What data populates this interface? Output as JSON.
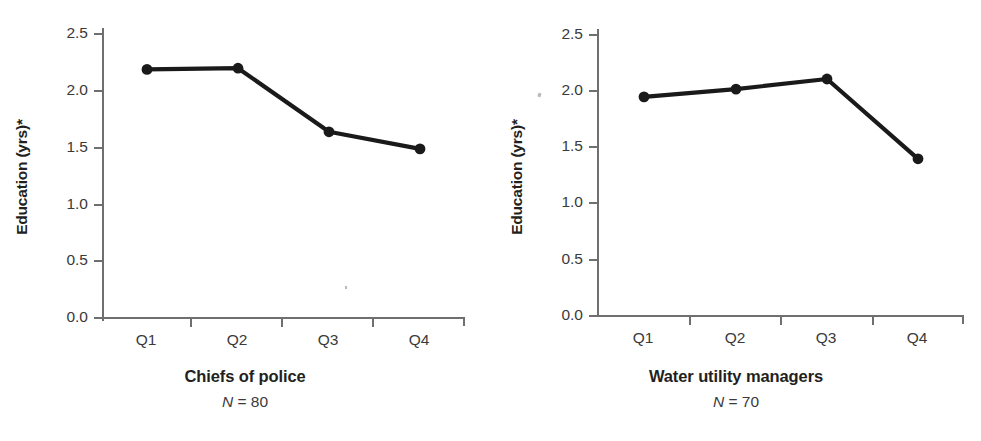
{
  "figure": {
    "background": "#ffffff",
    "ink_color": "#231f20",
    "axis_color": "#6f6f6f",
    "series_color": "#1a1a1a"
  },
  "chart_data": [
    {
      "type": "line",
      "title": "Chiefs of police",
      "subtitle": "N = 80",
      "n_label_variable": "N",
      "n_label_value": "= 80",
      "xlabel": "",
      "ylabel": "Education (yrs)*",
      "categories": [
        "Q1",
        "Q2",
        "Q3",
        "Q4"
      ],
      "values": [
        2.18,
        2.19,
        1.63,
        1.48
      ],
      "ylim": [
        0.0,
        2.5
      ],
      "yticks": [
        0.0,
        0.5,
        1.0,
        1.5,
        2.0,
        2.5
      ],
      "ytick_labels": [
        "0.0",
        "0.5",
        "1.0",
        "1.5",
        "2.0",
        "2.5"
      ],
      "grid": false,
      "legend": "none",
      "marker": "filled-circle"
    },
    {
      "type": "line",
      "title": "Water utility managers",
      "subtitle": "N = 70",
      "n_label_variable": "N",
      "n_label_value": "= 70",
      "xlabel": "",
      "ylabel": "Education (yrs)*",
      "categories": [
        "Q1",
        "Q2",
        "Q3",
        "Q4"
      ],
      "values": [
        1.94,
        2.01,
        2.1,
        1.39
      ],
      "ylim": [
        0.0,
        2.5
      ],
      "yticks": [
        0.0,
        0.5,
        1.0,
        1.5,
        2.0,
        2.5
      ],
      "ytick_labels": [
        "0.0",
        "0.5",
        "1.0",
        "1.5",
        "2.0",
        "2.5"
      ],
      "grid": false,
      "legend": "none",
      "marker": "filled-circle"
    }
  ],
  "panels": {
    "left": {
      "ylabel": "Education (yrs)*",
      "title": "Chiefs of police",
      "n_variable": "N",
      "n_rest": " = 80",
      "ytick_labels": [
        "2.5",
        "2.0",
        "1.5",
        "1.0",
        "0.5",
        "0.0"
      ],
      "xtick_labels": [
        "Q1",
        "Q2",
        "Q3",
        "Q4"
      ]
    },
    "right": {
      "ylabel": "Education (yrs)*",
      "title": "Water utility managers",
      "n_variable": "N",
      "n_rest": " = 70",
      "ytick_labels": [
        "2.5",
        "2.0",
        "1.5",
        "1.0",
        "0.5",
        "0.0"
      ],
      "xtick_labels": [
        "Q1",
        "Q2",
        "Q3",
        "Q4"
      ]
    }
  }
}
